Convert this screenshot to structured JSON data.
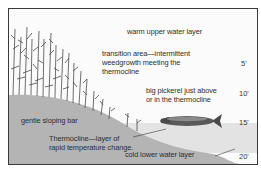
{
  "diagram": {
    "type": "lake cross-section showing thermocline",
    "labels": {
      "warm_layer": "warm upper water layer",
      "transition_line1": "transition area—intermittent",
      "transition_line2": "weedgrowth meeting the",
      "transition_line3": "thermocline",
      "pickerel_line1": "big pickerel just above",
      "pickerel_line2": "or in the thermocline",
      "bar": "gentle sloping bar",
      "thermocline_line1": "Thermocline—layer of",
      "thermocline_line2": "rapid temperature change.",
      "cold_layer": "cold lower water layer"
    },
    "depth_markers": [
      "5'",
      "10'",
      "15'",
      "20'"
    ],
    "colors": {
      "thermocline_band": "#e3e3e3",
      "bottom": "#b4b4b4",
      "weeds": "#4a4a4a",
      "border": "#3a3a3a"
    }
  }
}
